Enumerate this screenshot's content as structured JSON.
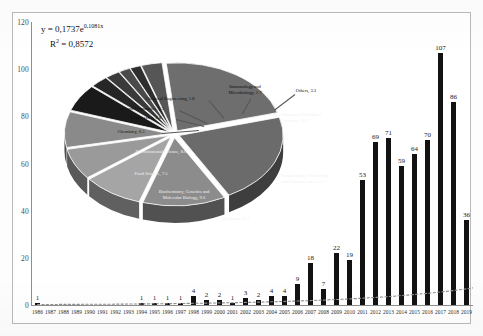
{
  "figure": {
    "title": "",
    "background_color": "#ffffff",
    "frame_color": "#b9b9b9"
  },
  "equation": {
    "fit_label": "y = 0,1737e",
    "fit_exponent": "0,1081x",
    "r2_label": "R",
    "r2_sup": "2",
    "r2_value": " = 0,8572"
  },
  "chart_data": [
    {
      "type": "bar",
      "title": "Publications per year",
      "xlabel": "",
      "ylabel": "",
      "ylim": [
        0,
        120
      ],
      "yticks": [
        0,
        20,
        40,
        60,
        80,
        100,
        120
      ],
      "grid": false,
      "legend": "none",
      "bar_color": "#121212",
      "trendline": {
        "type": "exponential",
        "equation": "y = 0,1737e^0,1081x",
        "r_squared": 0.8572,
        "style": "dotted",
        "color": "#8a8a8a"
      },
      "categories": [
        "1986",
        "1987",
        "1988",
        "1989",
        "1990",
        "1991",
        "1992",
        "1993",
        "1994",
        "1995",
        "1996",
        "1997",
        "1998",
        "1999",
        "2000",
        "2001",
        "2002",
        "2003",
        "2004",
        "2005",
        "2006",
        "2007",
        "2008",
        "2009",
        "2010",
        "2011",
        "2012",
        "2013",
        "2014",
        "2015",
        "2016",
        "2017",
        "2018",
        "2019"
      ],
      "values": [
        1,
        0,
        0,
        0,
        0,
        0,
        0,
        0,
        1,
        1,
        1,
        1,
        4,
        2,
        2,
        1,
        3,
        2,
        4,
        4,
        9,
        18,
        7,
        22,
        19,
        53,
        69,
        71,
        59,
        64,
        70,
        107,
        86,
        36
      ],
      "value_labels": [
        "1",
        "",
        "",
        "",
        "",
        "",
        "",
        "",
        "1",
        "1",
        "1",
        "1",
        "4",
        "2",
        "2",
        "1",
        "3",
        "2",
        "4",
        "4",
        "9",
        "18",
        "7",
        "22",
        "19",
        "53",
        "69",
        "71",
        "59",
        "64",
        "70",
        "107",
        "86",
        "36"
      ]
    },
    {
      "type": "pie",
      "title": "Subject area distribution (%)",
      "exploded": true,
      "three_d": true,
      "legend": "labels-on-slices",
      "labels": [
        "Agricultural and Biological Sciences",
        "Pharmacology, Toxicology and Pharmaceutics",
        "Medicine",
        "Biochemistry, Genetics and Molecular Biology",
        "Food Science",
        "Environmental Science",
        "Chemistry",
        "Engineering",
        "Arts and Humanities",
        "Chemical Engineering",
        "Immunology and Microbiology",
        "Others"
      ],
      "values": [
        22.7,
        21.7,
        13.1,
        9.6,
        7.5,
        8.6,
        6.5,
        2.8,
        2.3,
        1.8,
        1.7,
        3.3
      ],
      "label_texts": [
        "Agricultural and Biological\nSciences, 22.7",
        "Pharmacology, Toxicology\nand Pharmaceutics, 21.7",
        "Medicine, 13.1",
        "Biochemistry, Genetics and\nMolecular Biology, 9.6",
        "Food Science, 7.5",
        "Environmental Science, 8.6",
        "Chemistry, 6.5",
        "Engineering, 2.8",
        "Arts and Humanities, 2.3",
        "Chemical Engineering, 1.8",
        "Immunology and\nMicrobiology, 1.7",
        "Others, 3.3"
      ],
      "slice_colors": [
        "#6e6e6e",
        "#6b6b6b",
        "#8c8c8c",
        "#a5a5a5",
        "#9a9a9a",
        "#8a8a8a",
        "#1a1a1a",
        "#262626",
        "#3a3a3a",
        "#4a4a4a",
        "#2e2e2e",
        "#565656"
      ]
    }
  ],
  "pie_labels": [
    {
      "text": "Agricultural and Biological",
      "text2": "Sciences, 22.7",
      "x": 244,
      "y": 80,
      "tone": "light"
    },
    {
      "text": "Pharmacology, Toxicology",
      "text2": "and Pharmaceutics, 21.7",
      "x": 252,
      "y": 141,
      "tone": "light"
    },
    {
      "text": "Medicine, 13.1",
      "text2": "",
      "x": 184,
      "y": 181,
      "tone": "light"
    },
    {
      "text": "Biochemistry, Genetics and",
      "text2": "Molecular Biology, 9.6",
      "x": 132,
      "y": 157,
      "tone": "light"
    },
    {
      "text": "Food Science, 7.5",
      "text2": "",
      "x": 99,
      "y": 136,
      "tone": "light"
    },
    {
      "text": "Environmental Science, 8.6",
      "text2": "",
      "x": 109,
      "y": 114,
      "tone": "light"
    },
    {
      "text": "Chemistry, 6.5",
      "text2": "",
      "x": 79,
      "y": 94,
      "tone": "dark"
    },
    {
      "text": "Engineering, 2.8",
      "text2": "",
      "x": 94,
      "y": 80,
      "tone": "dark"
    },
    {
      "text": "Arts and Humanities, 2.3",
      "text2": "",
      "x": 89,
      "y": 71,
      "tone": "dark"
    },
    {
      "text": "Chemical Engineering, 1.8",
      "text2": "",
      "x": 118,
      "y": 61,
      "tone": "dark"
    },
    {
      "text": "Immunology and",
      "text2": "Microbiology, 1.7",
      "x": 193,
      "y": 52,
      "tone": "dark"
    },
    {
      "text": "Others, 3.3",
      "text2": "",
      "x": 254,
      "y": 53,
      "tone": "dark"
    }
  ]
}
